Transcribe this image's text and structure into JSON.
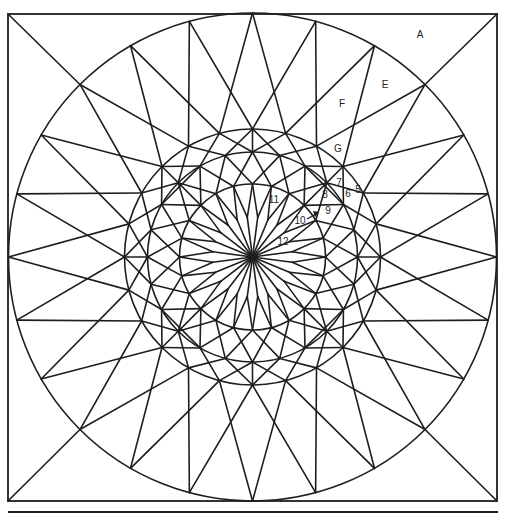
{
  "figure": {
    "frame": {
      "x1": 8,
      "y1": 14,
      "x2": 497,
      "y2": 501
    },
    "bottom_rule": {
      "x1": 8,
      "x2": 498,
      "y": 512
    },
    "center": {
      "x": 252.5,
      "y": 257
    },
    "rings": [
      244,
      128,
      105,
      73
    ],
    "angle_step_deg": 15,
    "center_star": {
      "tip_radius": 73,
      "valley_radius": 40,
      "points": 24
    },
    "stroke_color": "#1e1e1e",
    "background": "#ffffff"
  },
  "labels": [
    {
      "id": "A",
      "text": "A",
      "x": 420,
      "y": 34
    },
    {
      "id": "E",
      "text": "E",
      "x": 385,
      "y": 84
    },
    {
      "id": "F",
      "text": "F",
      "x": 342,
      "y": 103
    },
    {
      "id": "G",
      "text": "G",
      "x": 338,
      "y": 148
    },
    {
      "id": "7",
      "text": "7",
      "x": 339,
      "y": 182
    },
    {
      "id": "8",
      "text": "8",
      "x": 325,
      "y": 194
    },
    {
      "id": "6",
      "text": "6",
      "x": 348,
      "y": 193
    },
    {
      "id": "5",
      "text": "5",
      "x": 358,
      "y": 189
    },
    {
      "id": "9",
      "text": "9",
      "x": 328,
      "y": 210
    },
    {
      "id": "10",
      "text": "10",
      "x": 300,
      "y": 220
    },
    {
      "id": "11",
      "text": "11",
      "x": 274,
      "y": 199
    },
    {
      "id": "12",
      "text": "12",
      "x": 283,
      "y": 241
    }
  ],
  "pointer": {
    "label": "10",
    "from": [
      307,
      219
    ],
    "to": [
      316,
      214
    ]
  }
}
